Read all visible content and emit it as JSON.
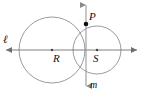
{
  "figure": {
    "stroke_color": "#8a8a8a",
    "point_color": "#111111",
    "label_color": "#111111",
    "background_color": "#ffffff"
  },
  "labels": {
    "line_l": "ℓ",
    "line_m": "m",
    "point_p": "P",
    "center_r": "R",
    "center_s": "S"
  },
  "geometry": {
    "line_l": {
      "name": "horizontal-line",
      "x1": 5,
      "y1": 50,
      "x2": 138,
      "y2": 50,
      "arrow_start": true,
      "arrow_end": true
    },
    "line_m": {
      "name": "vertical-line",
      "x1": 86,
      "y1": 4,
      "x2": 86,
      "y2": 87,
      "arrow_start": true,
      "arrow_end": true
    },
    "circle_r": {
      "name": "large-circle",
      "cx": 52,
      "cy": 50,
      "r": 33
    },
    "circle_s": {
      "name": "small-circle",
      "cx": 97,
      "cy": 50,
      "r": 24
    },
    "point_p": {
      "cx": 86,
      "cy": 24,
      "r": 2.2
    },
    "point_r": {
      "cx": 52,
      "cy": 50,
      "r": 1.1
    },
    "point_s": {
      "cx": 97,
      "cy": 50,
      "r": 1.1
    }
  }
}
